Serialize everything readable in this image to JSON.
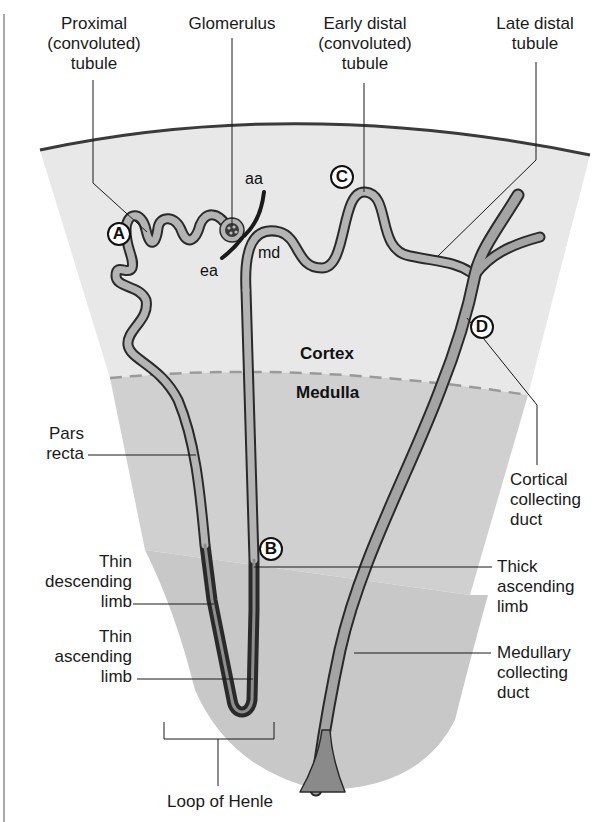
{
  "diagram": {
    "colors": {
      "background": "#ffffff",
      "cortex_fill": "#e8e8e8",
      "outer_medulla_fill": "#d0d0d0",
      "inner_medulla_fill": "#c6c6c6",
      "capsule_line": "#3a3a3a",
      "boundary_dashes": "#9a9a9a",
      "tubule_fill": "#b4b4b4",
      "tubule_outline": "#2a2a2a",
      "duct_fill": "#9a9a9a",
      "leader_line": "#1a1a1a"
    },
    "regions": {
      "cortex": "Cortex",
      "medulla": "Medulla"
    },
    "markers": {
      "a": "A",
      "b": "B",
      "c": "C",
      "d": "D"
    },
    "abbreviations": {
      "aa": "aa",
      "ea": "ea",
      "md": "md"
    },
    "labels": {
      "proximal_tubule": "Proximal\n(convoluted)\ntubule",
      "glomerulus": "Glomerulus",
      "early_distal_tubule": "Early distal\n(convoluted)\ntubule",
      "late_distal_tubule": "Late distal\ntubule",
      "pars_recta": "Pars\nrecta",
      "thin_descending_limb": "Thin\ndescending\nlimb",
      "thin_ascending_limb": "Thin\nascending\nlimb",
      "cortical_collecting_duct": "Cortical\ncollecting\nduct",
      "thick_ascending_limb": "Thick\nascending\nlimb",
      "medullary_collecting_duct": "Medullary\ncollecting\nduct",
      "loop_of_henle": "Loop of Henle"
    }
  }
}
